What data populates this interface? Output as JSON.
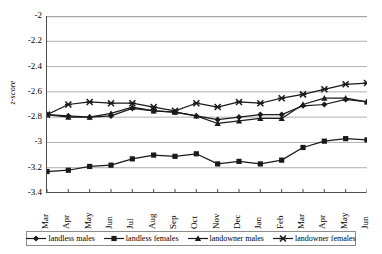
{
  "chart_data": {
    "type": "line",
    "title": "",
    "xlabel": "",
    "ylabel": "z-score",
    "ylim": [
      -3.4,
      -2.0
    ],
    "yticks": [
      "-2",
      "-2.2",
      "-2.4",
      "-2.6",
      "-2.8",
      "-3",
      "-3.2",
      "-3.4"
    ],
    "ytick_values": [
      -2.0,
      -2.2,
      -2.4,
      -2.6,
      -2.8,
      -3.0,
      -3.2,
      -3.4
    ],
    "grid": true,
    "grid_axis": "y",
    "legend_position": "bottom",
    "categories": [
      "Mar",
      "Apr",
      "May",
      "Jun",
      "Jul",
      "Aug",
      "Sep",
      "Oct",
      "Nov",
      "Dec",
      "Jan",
      "Feb",
      "Mar",
      "Apr",
      "May",
      "Jun"
    ],
    "series": [
      {
        "name": "landless males",
        "marker": "diamond",
        "color": "#1a1a1a",
        "values": [
          -2.78,
          -2.79,
          -2.8,
          -2.79,
          -2.73,
          -2.75,
          -2.76,
          -2.79,
          -2.82,
          -2.8,
          -2.78,
          -2.78,
          -2.71,
          -2.7,
          -2.66,
          -2.68
        ]
      },
      {
        "name": "landless females",
        "marker": "square",
        "color": "#1a1a1a",
        "values": [
          -3.23,
          -3.22,
          -3.19,
          -3.18,
          -3.13,
          -3.1,
          -3.11,
          -3.09,
          -3.17,
          -3.15,
          -3.17,
          -3.14,
          -3.04,
          -2.99,
          -2.97,
          -2.98
        ]
      },
      {
        "name": "landowner males",
        "marker": "triangle",
        "color": "#1a1a1a",
        "values": [
          -2.78,
          -2.8,
          -2.8,
          -2.77,
          -2.72,
          -2.75,
          -2.76,
          -2.79,
          -2.85,
          -2.83,
          -2.81,
          -2.81,
          -2.7,
          -2.65,
          -2.65,
          -2.68
        ]
      },
      {
        "name": "landowner females",
        "marker": "x",
        "color": "#1a1a1a",
        "values": [
          -2.78,
          -2.7,
          -2.68,
          -2.69,
          -2.69,
          -2.72,
          -2.75,
          -2.69,
          -2.72,
          -2.68,
          -2.69,
          -2.65,
          -2.62,
          -2.58,
          -2.54,
          -2.53
        ]
      }
    ]
  },
  "axis": {
    "y_title": "z-score"
  },
  "legend": {
    "entries": [
      {
        "label": "landless males",
        "marker": "diamond"
      },
      {
        "label": "landless females",
        "marker": "square"
      },
      {
        "label": "landowner males",
        "marker": "triangle"
      },
      {
        "label": "landowner females",
        "marker": "x"
      }
    ]
  },
  "style": {
    "line_color": "#1a1a1a",
    "grid_color": "#a6a6a6",
    "axis_color": "#4d4d4d",
    "background": "#ffffff"
  }
}
